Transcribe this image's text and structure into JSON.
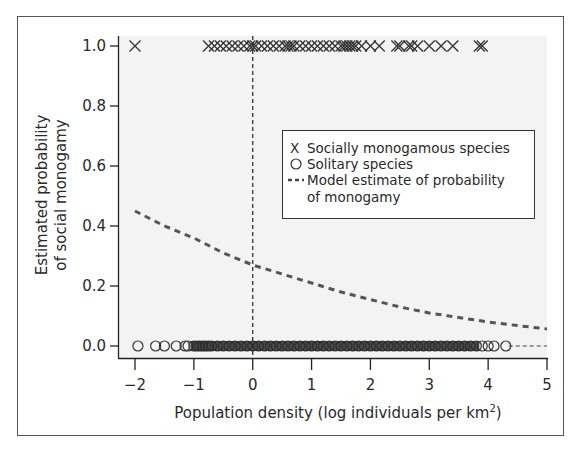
{
  "chart_data": {
    "type": "scatter",
    "title": "",
    "xlabel": "Population density (log individuals per km",
    "xlabel_superscript": "2",
    "xlabel_close": ")",
    "ylabel_line1": "Estimated probability",
    "ylabel_line2": "of social monogamy",
    "xlim": [
      -2,
      5
    ],
    "ylim": [
      0.0,
      1.0
    ],
    "x_ticks": [
      -2,
      -1,
      0,
      1,
      2,
      3,
      4,
      5
    ],
    "x_tick_labels": [
      "−2",
      "−1",
      "0",
      "1",
      "2",
      "3",
      "4",
      "5"
    ],
    "y_ticks": [
      0.0,
      0.2,
      0.4,
      0.6,
      0.8,
      1.0
    ],
    "y_tick_labels": [
      "0.0",
      "0.2",
      "0.4",
      "0.6",
      "0.8",
      "1.0"
    ],
    "grid": false,
    "reference_line": {
      "orientation": "vertical",
      "x": 0,
      "style": "dashed"
    },
    "legend": {
      "position": "upper right (inside)",
      "entries": [
        {
          "symbol": "X",
          "label": "Socially monogamous species"
        },
        {
          "symbol": "O",
          "label": "Solitary species"
        },
        {
          "symbol": "--",
          "label": "Model estimate of probability",
          "label_line2": "of monogamy"
        }
      ]
    },
    "series": [
      {
        "name": "Socially monogamous species",
        "marker": "x",
        "y": 1.0,
        "x": [
          -2.0,
          -0.75,
          -0.65,
          -0.55,
          -0.45,
          -0.35,
          -0.25,
          -0.15,
          -0.05,
          0.0,
          0.05,
          0.15,
          0.25,
          0.35,
          0.45,
          0.55,
          0.6,
          0.65,
          0.7,
          0.8,
          0.9,
          1.0,
          1.1,
          1.2,
          1.3,
          1.4,
          1.5,
          1.55,
          1.6,
          1.65,
          1.7,
          1.75,
          1.85,
          2.0,
          2.15,
          2.45,
          2.5,
          2.65,
          2.7,
          2.8,
          3.0,
          3.2,
          3.4,
          3.85,
          3.9
        ]
      },
      {
        "name": "Solitary species",
        "marker": "o",
        "y": 0.0,
        "x": [
          -1.95,
          -1.65,
          -1.5,
          -1.3,
          -1.15,
          -1.1,
          -1.0,
          -0.95,
          -0.9,
          -0.85,
          -0.8,
          -0.75,
          -0.7,
          -0.6,
          -0.5,
          -0.4,
          -0.3,
          -0.2,
          -0.1,
          0.0,
          0.1,
          0.2,
          0.3,
          0.4,
          0.5,
          0.6,
          0.7,
          0.8,
          0.9,
          1.0,
          1.1,
          1.2,
          1.3,
          1.4,
          1.5,
          1.6,
          1.7,
          1.8,
          1.9,
          2.0,
          2.1,
          2.2,
          2.3,
          2.4,
          2.5,
          2.6,
          2.7,
          2.8,
          2.9,
          3.0,
          3.1,
          3.2,
          3.3,
          3.4,
          3.5,
          3.6,
          3.7,
          3.8,
          3.9,
          4.0,
          4.1,
          4.3
        ]
      },
      {
        "name": "Model estimate of probability of monogamy",
        "style": "dashed",
        "x": [
          -2,
          -1.5,
          -1,
          -0.5,
          0,
          0.5,
          1,
          1.5,
          2,
          2.5,
          3,
          3.5,
          4,
          4.5,
          5
        ],
        "y": [
          0.45,
          0.4,
          0.36,
          0.31,
          0.27,
          0.24,
          0.21,
          0.18,
          0.155,
          0.13,
          0.11,
          0.095,
          0.08,
          0.068,
          0.057
        ]
      }
    ]
  }
}
